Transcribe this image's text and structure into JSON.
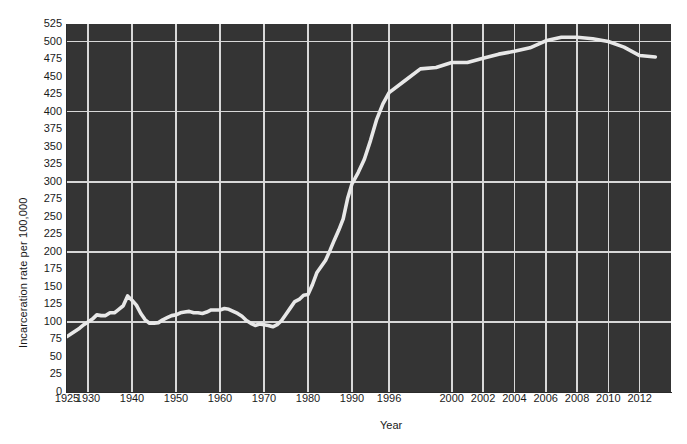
{
  "chart_data": {
    "type": "line",
    "title": "",
    "xlabel": "Year",
    "ylabel": "Incarceration rate per 100,000",
    "ylim": [
      0,
      525
    ],
    "ytick_step": 25,
    "ytick_labels": [
      "525",
      "500",
      "475",
      "450",
      "425",
      "400",
      "375",
      "350",
      "325",
      "300",
      "275",
      "250",
      "225",
      "200",
      "175",
      "150",
      "125",
      "100",
      "75",
      "50",
      "25",
      "0"
    ],
    "ytick_values": [
      525,
      500,
      475,
      450,
      425,
      400,
      375,
      350,
      325,
      300,
      275,
      250,
      225,
      200,
      175,
      150,
      125,
      100,
      75,
      50,
      25,
      0
    ],
    "gridlines_y": [
      100,
      200,
      300,
      400,
      500
    ],
    "xtick_labels": [
      "1925",
      "1930",
      "1940",
      "1950",
      "1960",
      "1970",
      "1980",
      "1990",
      "1996",
      "2000",
      "2002",
      "2004",
      "2006",
      "2008",
      "2010",
      "2012"
    ],
    "xtick_values": [
      1925,
      1930,
      1940,
      1950,
      1960,
      1970,
      1980,
      1990,
      1996,
      2000,
      2002,
      2004,
      2006,
      2008,
      2010,
      2012
    ],
    "grid": true,
    "legend": "none",
    "plot_background": "#343434",
    "gridline_color": "#d8d8d8",
    "line_color": "#e8e8e8",
    "page_background": "#ffffff",
    "x": [
      1925,
      1926,
      1927,
      1928,
      1929,
      1930,
      1931,
      1932,
      1933,
      1934,
      1935,
      1936,
      1937,
      1938,
      1939,
      1940,
      1941,
      1942,
      1943,
      1944,
      1945,
      1946,
      1947,
      1948,
      1949,
      1950,
      1951,
      1952,
      1953,
      1954,
      1955,
      1956,
      1957,
      1958,
      1959,
      1960,
      1961,
      1962,
      1963,
      1964,
      1965,
      1966,
      1967,
      1968,
      1969,
      1970,
      1971,
      1972,
      1973,
      1974,
      1975,
      1976,
      1977,
      1978,
      1979,
      1980,
      1981,
      1982,
      1983,
      1984,
      1985,
      1986,
      1987,
      1988,
      1989,
      1990,
      1991,
      1992,
      1993,
      1994,
      1995,
      1996,
      1997,
      1998,
      1999,
      2000,
      2001,
      2002,
      2003,
      2004,
      2005,
      2006,
      2007,
      2008,
      2009,
      2010,
      2011,
      2012,
      2013
    ],
    "values": [
      79,
      83,
      87,
      91,
      96,
      100,
      104,
      110,
      109,
      109,
      113,
      113,
      118,
      123,
      137,
      131,
      124,
      112,
      103,
      98,
      98,
      99,
      103,
      106,
      109,
      110,
      113,
      114,
      115,
      113,
      113,
      112,
      114,
      117,
      117,
      117,
      119,
      118,
      115,
      112,
      108,
      102,
      98,
      95,
      97,
      96,
      95,
      93,
      96,
      102,
      111,
      120,
      129,
      132,
      138,
      139,
      153,
      170,
      179,
      188,
      202,
      217,
      231,
      247,
      276,
      297,
      313,
      332,
      359,
      389,
      411,
      427,
      444,
      461,
      463,
      470,
      470,
      476,
      482,
      486,
      491,
      501,
      506,
      506,
      504,
      500,
      492,
      480,
      478
    ],
    "annotations": []
  }
}
